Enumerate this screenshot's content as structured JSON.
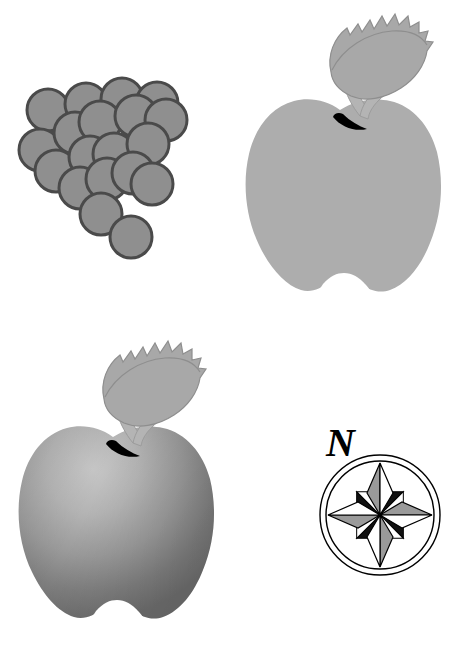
{
  "page": {
    "background_color": "#ffffff",
    "width": 454,
    "height": 654,
    "columns": 2,
    "rows": 2
  },
  "palette": {
    "white": "#ffffff",
    "black": "#000000",
    "grape_fill": "#8f8f8f",
    "grape_outline": "#4a4a4a",
    "apple_flat_fill": "#adadad",
    "apple_leaf_fill": "#a8a8a8",
    "apple_leaf_outline": "#8e8e8e",
    "apple_stem_fill": "#b4b4b4",
    "apple_calyx": "#000000",
    "apple_gradient_light": "#c2c2c2",
    "apple_gradient_mid": "#a0a0a0",
    "apple_gradient_dark": "#707070",
    "compass_stroke": "#000000",
    "compass_point_gray": "#9a9a9a",
    "compass_point_white": "#ffffff",
    "compass_point_black": "#111111"
  },
  "figures": [
    {
      "id": "grape-cluster",
      "name": "Grape cluster",
      "cell": "top-left",
      "shape": "circles",
      "berry_count": 19,
      "berry_radius": 21,
      "fill": "#8f8f8f",
      "outline": "#4a4a4a",
      "outline_width": 3,
      "berries": [
        {
          "cx": 48,
          "cy": 110
        },
        {
          "cx": 86,
          "cy": 104
        },
        {
          "cx": 122,
          "cy": 99
        },
        {
          "cx": 157,
          "cy": 103
        },
        {
          "cx": 40,
          "cy": 150
        },
        {
          "cx": 75,
          "cy": 133
        },
        {
          "cx": 100,
          "cy": 122
        },
        {
          "cx": 136,
          "cy": 116
        },
        {
          "cx": 166,
          "cy": 120
        },
        {
          "cx": 56,
          "cy": 171
        },
        {
          "cx": 90,
          "cy": 157
        },
        {
          "cx": 114,
          "cy": 154
        },
        {
          "cx": 148,
          "cy": 144
        },
        {
          "cx": 80,
          "cy": 188
        },
        {
          "cx": 107,
          "cy": 179
        },
        {
          "cx": 133,
          "cy": 173
        },
        {
          "cx": 152,
          "cy": 184
        },
        {
          "cx": 101,
          "cy": 214
        },
        {
          "cx": 131,
          "cy": 237
        }
      ]
    },
    {
      "id": "apple-flat",
      "name": "Apple with leaf (flat gray)",
      "cell": "top-right",
      "shape": "apple",
      "shading": "flat",
      "body_fill": "#adadad",
      "leaf_fill": "#a8a8a8",
      "leaf_outline": "#8e8e8e",
      "stem_fill": "#b4b4b4",
      "calyx_fill": "#000000",
      "has_leaf": true,
      "has_stem": true,
      "has_calyx_crescent": true,
      "has_bottom_notch": true
    },
    {
      "id": "apple-gradient",
      "name": "Apple with leaf (gradient shaded)",
      "cell": "bottom-left",
      "shape": "apple",
      "shading": "gradient",
      "gradient_light": "#c2c2c2",
      "gradient_mid": "#a0a0a0",
      "gradient_dark": "#707070",
      "gradient_highlight_x": "38%",
      "gradient_highlight_y": "22%",
      "leaf_fill": "#a8a8a8",
      "leaf_outline": "#8e8e8e",
      "stem_fill": "#b4b4b4",
      "calyx_fill": "#000000",
      "has_leaf": true,
      "has_stem": true,
      "has_calyx_crescent": true,
      "has_bottom_notch": true
    },
    {
      "id": "compass-rose",
      "name": "Compass rose",
      "cell": "bottom-right",
      "shape": "compass",
      "label": "N",
      "label_position": "above",
      "outer_circle_radius": 60,
      "inner_circle_radius": 54,
      "cardinal_point_length": 52,
      "ordinal_point_length": 33,
      "stroke": "#000000",
      "stroke_width": 1.4,
      "cardinal_points": [
        "N",
        "E",
        "S",
        "W"
      ],
      "ordinal_points": [
        "NE",
        "SE",
        "SW",
        "NW"
      ],
      "cardinal_left_fill": "#9a9a9a",
      "cardinal_right_fill": "#ffffff",
      "ordinal_left_fill": "#111111",
      "ordinal_right_fill": "#ffffff"
    }
  ]
}
